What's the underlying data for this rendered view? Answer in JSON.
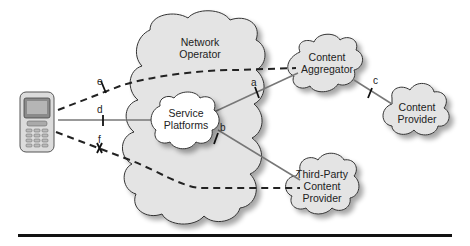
{
  "nodes": {
    "handset": {
      "label": "Mobile Handset"
    },
    "network_operator": {
      "label_line1": "Network",
      "label_line2": "Operator"
    },
    "service_platforms": {
      "label_line1": "Service",
      "label_line2": "Platforms"
    },
    "content_aggregator": {
      "label_line1": "Content",
      "label_line2": "Aggregator"
    },
    "content_provider": {
      "label_line1": "Content",
      "label_line2": "Provider"
    },
    "third_party": {
      "label_line1": "Third-Party",
      "label_line2": "Content",
      "label_line3": "Provider"
    }
  },
  "edges": {
    "a": "a",
    "b": "b",
    "c": "c",
    "d": "d",
    "e": "e",
    "f": "f"
  },
  "colors": {
    "cloud_fill": "#e4e4e4",
    "cloud_shadow": "#b8b8b8",
    "inner_cloud_fill": "#ffffff",
    "solid_line": "#777777",
    "dashed_line": "#222222"
  }
}
